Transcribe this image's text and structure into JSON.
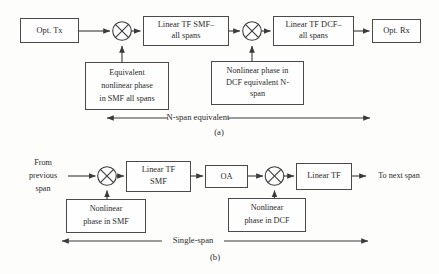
{
  "figure": {
    "type": "block-diagram",
    "panels": [
      {
        "id": "a",
        "caption": "(a)",
        "span_label": "N-span equivalent",
        "blocks": [
          {
            "id": "opt-tx",
            "label": "Opt. Tx",
            "lines": [
              "Opt. Tx"
            ]
          },
          {
            "id": "linear-tf-smf-all-spans",
            "label": "Linear TF SMF–all spans",
            "lines": [
              "Linear TF SMF–",
              "all spans"
            ]
          },
          {
            "id": "linear-tf-dcf-all-spans",
            "label": "Linear TF DCF–all spans",
            "lines": [
              "Linear TF DCF–",
              "all spans"
            ]
          },
          {
            "id": "opt-rx",
            "label": "Opt. Rx",
            "lines": [
              "Opt. Rx"
            ]
          },
          {
            "id": "equivalent-nonlinear-phase-smf",
            "label": "Equivalent nonlinear phase in SMF all spans",
            "lines": [
              "Equivalent",
              "nonlinear phase",
              "in SMF all spans"
            ]
          },
          {
            "id": "nonlinear-phase-dcf-nspan",
            "label": "Nonlinear phase in DCF equivalent N-span",
            "lines": [
              "Nonlinear phase in",
              "DCF equivalent N-",
              "span"
            ]
          }
        ],
        "operators": [
          {
            "id": "mixer-1",
            "symbol": "⊗"
          },
          {
            "id": "mixer-2",
            "symbol": "⊗"
          }
        ]
      },
      {
        "id": "b",
        "caption": "(b)",
        "span_label": "Single-span",
        "blocks": [
          {
            "id": "linear-tf-smf",
            "label": "Linear TF SMF",
            "lines": [
              "Linear TF",
              "SMF"
            ]
          },
          {
            "id": "oa",
            "label": "OA",
            "lines": [
              "OA"
            ]
          },
          {
            "id": "linear-tf",
            "label": "Linear TF",
            "lines": [
              "Linear TF"
            ]
          },
          {
            "id": "nonlinear-phase-smf",
            "label": "Nonlinear phase in SMF",
            "lines": [
              "Nonlinear",
              "phase in SMF"
            ]
          },
          {
            "id": "nonlinear-phase-dcf",
            "label": "Nonlinear phase in DCF",
            "lines": [
              "Nonlinear",
              "phase in DCF"
            ]
          }
        ],
        "labels": [
          {
            "id": "from-previous-span",
            "label": "From previous span",
            "lines": [
              "From",
              "previous",
              "span"
            ]
          },
          {
            "id": "to-next-span",
            "label": "To next span",
            "lines": [
              "To next span"
            ]
          }
        ],
        "operators": [
          {
            "id": "mixer-3",
            "symbol": "⊗"
          },
          {
            "id": "mixer-4",
            "symbol": "⊗"
          }
        ]
      }
    ],
    "colors": {
      "background": "#fdfdfc",
      "box_fill": "#fefefe",
      "box_stroke": "#4a4a4a",
      "line": "#3a3a3a",
      "text": "#2b2b2b"
    }
  }
}
